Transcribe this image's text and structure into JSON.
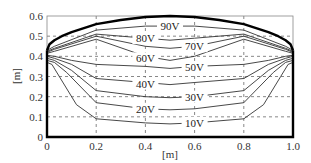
{
  "chart_data": {
    "type": "line",
    "title": "",
    "xlabel": "[m]",
    "ylabel": "[m]",
    "xlim": [
      0,
      1.0
    ],
    "ylim": [
      0,
      0.6
    ],
    "xticks": [
      "0",
      "0.2",
      "0.4",
      "0.6",
      "0.8",
      "1.0"
    ],
    "yticks": [
      "0",
      "0.1",
      "0.2",
      "0.3",
      "0.4",
      "0.5",
      "0.6"
    ],
    "grid": "dashed",
    "boundary": {
      "name": "electrode boundary (100V)",
      "x": [
        0,
        0.01,
        0.03,
        0.06,
        0.1,
        0.15,
        0.2,
        0.3,
        0.4,
        0.5,
        0.6,
        0.7,
        0.8,
        0.85,
        0.9,
        0.94,
        0.97,
        0.99,
        1.0
      ],
      "y": [
        0.43,
        0.46,
        0.48,
        0.5,
        0.52,
        0.54,
        0.56,
        0.58,
        0.595,
        0.6,
        0.595,
        0.58,
        0.56,
        0.54,
        0.52,
        0.5,
        0.48,
        0.46,
        0.43
      ]
    },
    "series": [
      {
        "name": "90V",
        "x": [
          0,
          0.03,
          0.2,
          0.4,
          0.5,
          0.6,
          0.8,
          0.97,
          1.0
        ],
        "y": [
          0.43,
          0.45,
          0.53,
          0.55,
          0.55,
          0.55,
          0.53,
          0.45,
          0.43
        ]
      },
      {
        "name": "80V",
        "x": [
          0,
          0.03,
          0.2,
          0.4,
          0.5,
          0.6,
          0.8,
          0.97,
          1.0
        ],
        "y": [
          0.425,
          0.44,
          0.51,
          0.49,
          0.48,
          0.49,
          0.51,
          0.44,
          0.425
        ]
      },
      {
        "name": "70V",
        "x": [
          0,
          0.03,
          0.2,
          0.4,
          0.5,
          0.6,
          0.8,
          0.97,
          1.0
        ],
        "y": [
          0.42,
          0.435,
          0.5,
          0.45,
          0.44,
          0.45,
          0.5,
          0.435,
          0.42
        ]
      },
      {
        "name": "60V",
        "x": [
          0,
          0.03,
          0.2,
          0.4,
          0.5,
          0.6,
          0.8,
          0.97,
          1.0
        ],
        "y": [
          0.415,
          0.425,
          0.485,
          0.4,
          0.38,
          0.4,
          0.485,
          0.425,
          0.415
        ]
      },
      {
        "name": "50V",
        "x": [
          0,
          0.03,
          0.1,
          0.2,
          0.4,
          0.5,
          0.6,
          0.8,
          0.9,
          0.97,
          1.0
        ],
        "y": [
          0.405,
          0.4,
          0.38,
          0.36,
          0.35,
          0.34,
          0.35,
          0.36,
          0.38,
          0.4,
          0.405
        ]
      },
      {
        "name": "40V",
        "x": [
          0,
          0.03,
          0.1,
          0.2,
          0.4,
          0.5,
          0.6,
          0.8,
          0.9,
          0.97,
          1.0
        ],
        "y": [
          0.4,
          0.39,
          0.36,
          0.29,
          0.27,
          0.26,
          0.27,
          0.29,
          0.36,
          0.39,
          0.4
        ]
      },
      {
        "name": "30V",
        "x": [
          0,
          0.03,
          0.1,
          0.2,
          0.4,
          0.5,
          0.6,
          0.8,
          0.9,
          0.97,
          1.0
        ],
        "y": [
          0.39,
          0.38,
          0.33,
          0.23,
          0.2,
          0.195,
          0.2,
          0.23,
          0.33,
          0.38,
          0.39
        ]
      },
      {
        "name": "20V",
        "x": [
          0,
          0.03,
          0.08,
          0.2,
          0.4,
          0.5,
          0.6,
          0.8,
          0.92,
          0.97,
          1.0
        ],
        "y": [
          0.38,
          0.37,
          0.32,
          0.17,
          0.14,
          0.135,
          0.14,
          0.17,
          0.32,
          0.37,
          0.38
        ]
      },
      {
        "name": "10V",
        "x": [
          0,
          0.02,
          0.05,
          0.12,
          0.2,
          0.4,
          0.5,
          0.6,
          0.8,
          0.88,
          0.95,
          0.98,
          1.0
        ],
        "y": [
          0.37,
          0.36,
          0.3,
          0.16,
          0.09,
          0.07,
          0.065,
          0.07,
          0.09,
          0.16,
          0.3,
          0.36,
          0.37
        ]
      }
    ],
    "contour_labels": [
      {
        "text": "90V",
        "x": 0.5,
        "y": 0.55
      },
      {
        "text": "80V",
        "x": 0.4,
        "y": 0.49
      },
      {
        "text": "70V",
        "x": 0.6,
        "y": 0.45
      },
      {
        "text": "60V",
        "x": 0.4,
        "y": 0.39
      },
      {
        "text": "50V",
        "x": 0.6,
        "y": 0.345
      },
      {
        "text": "40V",
        "x": 0.4,
        "y": 0.265
      },
      {
        "text": "30V",
        "x": 0.6,
        "y": 0.2
      },
      {
        "text": "20V",
        "x": 0.4,
        "y": 0.14
      },
      {
        "text": "10V",
        "x": 0.6,
        "y": 0.07
      }
    ]
  }
}
